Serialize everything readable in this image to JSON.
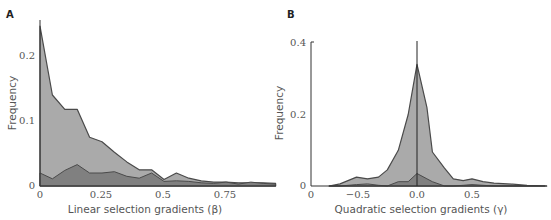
{
  "chart_data": [
    {
      "panel": "A",
      "type": "area",
      "title": "",
      "xlabel": "Linear selection gradients (β)",
      "ylabel": "Frequency",
      "xlim": [
        0,
        0.95
      ],
      "ylim": [
        0,
        0.25
      ],
      "xticks": [
        "0",
        "0.25",
        "0.5",
        "0.75"
      ],
      "yticks": [
        "0",
        "0.1",
        "0.2"
      ],
      "grid": false,
      "x": [
        0,
        0.05,
        0.1,
        0.15,
        0.2,
        0.25,
        0.3,
        0.35,
        0.4,
        0.45,
        0.5,
        0.55,
        0.6,
        0.65,
        0.7,
        0.75,
        0.8,
        0.85,
        0.9,
        0.95
      ],
      "series": [
        {
          "name": "total (light)",
          "color": "#aaaaaa",
          "values": [
            0.246,
            0.14,
            0.118,
            0.118,
            0.075,
            0.068,
            0.052,
            0.037,
            0.025,
            0.025,
            0.01,
            0.02,
            0.012,
            0.008,
            0.006,
            0.006,
            0.005,
            0.005,
            0.005,
            0.004
          ]
        },
        {
          "name": "subset (dark)",
          "color": "#808080",
          "values": [
            0.02,
            0.011,
            0.024,
            0.033,
            0.02,
            0.02,
            0.022,
            0.015,
            0.012,
            0.02,
            0.007,
            0.008,
            0.007,
            0.005,
            0.004,
            0.006,
            0.003,
            0.006,
            0.004,
            0.003
          ]
        }
      ]
    },
    {
      "panel": "B",
      "type": "area",
      "title": "",
      "xlabel": "Quadratic selection gradients (γ)",
      "ylabel": "Frequency",
      "xlim": [
        -0.96,
        1.2
      ],
      "ylim": [
        0,
        0.4
      ],
      "xticks": [
        "0",
        "−0.5",
        "0.0",
        "0.5"
      ],
      "yticks": [
        "0",
        "0.2",
        "0.4"
      ],
      "grid": false,
      "reference_line_x": 0.0,
      "x": [
        -0.8,
        -0.7,
        -0.55,
        -0.45,
        -0.35,
        -0.27,
        -0.17,
        -0.08,
        0.0,
        0.09,
        0.14,
        0.25,
        0.33,
        0.42,
        0.5,
        0.6,
        0.7,
        0.87,
        1.0,
        1.18
      ],
      "series": [
        {
          "name": "total (light)",
          "color": "#aaaaaa",
          "values": [
            0,
            0.006,
            0.025,
            0.02,
            0.025,
            0.045,
            0.1,
            0.2,
            0.34,
            0.22,
            0.095,
            0.05,
            0.02,
            0.015,
            0.02,
            0.012,
            0.008,
            0.005,
            0.002,
            0
          ]
        },
        {
          "name": "subset (dark)",
          "color": "#808080",
          "values": [
            0,
            0,
            0.004,
            0.006,
            0.002,
            0,
            0.012,
            0.012,
            0.035,
            0.02,
            0.012,
            0,
            0,
            0.002,
            0.004,
            0.002,
            0,
            0,
            0,
            0
          ]
        }
      ]
    }
  ],
  "panels": {
    "a": {
      "label": "A",
      "ylabel": "Frequency",
      "xlabel": "Linear selection gradients (β)",
      "yticks": [
        "0",
        "0.1",
        "0.2"
      ],
      "xticks": [
        "0",
        "0.25",
        "0.5",
        "0.75"
      ]
    },
    "b": {
      "label": "B",
      "ylabel": "Frequency",
      "xlabel": "Quadratic selection gradients (γ)",
      "yticks": [
        "0",
        "0.2",
        "0.4"
      ],
      "xticks": [
        "0",
        "−0.5",
        "0.0",
        "0.5"
      ]
    }
  },
  "colors": {
    "light_fill": "#aaaaaa",
    "dark_fill": "#808080",
    "outline": "#4a4a4a",
    "axis": "#333333"
  }
}
